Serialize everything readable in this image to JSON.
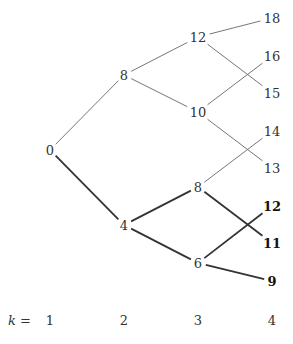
{
  "diagram": {
    "type": "tree",
    "levels": [
      {
        "k": 1,
        "x": 50
      },
      {
        "k": 2,
        "x": 124
      },
      {
        "k": 3,
        "x": 198
      },
      {
        "k": 4,
        "x": 272
      }
    ],
    "k_label": "k =",
    "k_values": [
      "1",
      "2",
      "3",
      "4"
    ],
    "nodes": [
      {
        "id": "n0",
        "label": "0",
        "level": 1,
        "x": 50,
        "y": 150,
        "bold": false
      },
      {
        "id": "n8a",
        "label": "8",
        "level": 2,
        "x": 124,
        "y": 75,
        "bold": false
      },
      {
        "id": "n4",
        "label": "4",
        "level": 2,
        "x": 124,
        "y": 225,
        "bold": false
      },
      {
        "id": "n12a",
        "label": "12",
        "level": 3,
        "x": 198,
        "y": 37,
        "bold": false
      },
      {
        "id": "n10",
        "label": "10",
        "level": 3,
        "x": 198,
        "y": 112,
        "bold": false
      },
      {
        "id": "n8b",
        "label": "8",
        "level": 3,
        "x": 198,
        "y": 187,
        "bold": false
      },
      {
        "id": "n6",
        "label": "6",
        "level": 3,
        "x": 198,
        "y": 263,
        "bold": false
      },
      {
        "id": "n18",
        "label": "18",
        "level": 4,
        "x": 272,
        "y": 18,
        "bold": false
      },
      {
        "id": "n16",
        "label": "16",
        "level": 4,
        "x": 272,
        "y": 56,
        "bold": false
      },
      {
        "id": "n15",
        "label": "15",
        "level": 4,
        "x": 272,
        "y": 93,
        "bold": false
      },
      {
        "id": "n14",
        "label": "14",
        "level": 4,
        "x": 272,
        "y": 131,
        "bold": false
      },
      {
        "id": "n13",
        "label": "13",
        "level": 4,
        "x": 272,
        "y": 168,
        "bold": false
      },
      {
        "id": "n12b",
        "label": "12",
        "level": 4,
        "x": 272,
        "y": 206,
        "bold": true
      },
      {
        "id": "n11",
        "label": "11",
        "level": 4,
        "x": 272,
        "y": 243,
        "bold": true
      },
      {
        "id": "n9",
        "label": "9",
        "level": 4,
        "x": 272,
        "y": 281,
        "bold": true
      }
    ],
    "edges": [
      {
        "from": "n0",
        "to": "n8a",
        "bold": false
      },
      {
        "from": "n0",
        "to": "n4",
        "bold": true
      },
      {
        "from": "n8a",
        "to": "n12a",
        "bold": false
      },
      {
        "from": "n8a",
        "to": "n10",
        "bold": false
      },
      {
        "from": "n4",
        "to": "n8b",
        "bold": true
      },
      {
        "from": "n4",
        "to": "n6",
        "bold": true
      },
      {
        "from": "n12a",
        "to": "n18",
        "bold": false
      },
      {
        "from": "n12a",
        "to": "n15",
        "bold": false
      },
      {
        "from": "n10",
        "to": "n16",
        "bold": false
      },
      {
        "from": "n10",
        "to": "n13",
        "bold": false
      },
      {
        "from": "n8b",
        "to": "n14",
        "bold": false
      },
      {
        "from": "n8b",
        "to": "n11",
        "bold": true
      },
      {
        "from": "n6",
        "to": "n12b",
        "bold": true
      },
      {
        "from": "n6",
        "to": "n9",
        "bold": true
      }
    ]
  }
}
